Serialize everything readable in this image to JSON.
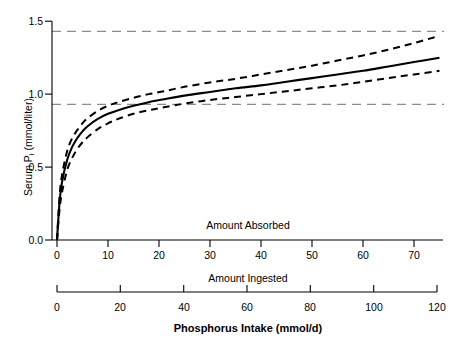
{
  "chart_data": {
    "type": "line",
    "title": "Phosphorus Intake (mmol/d)",
    "ylabel_prefix": "Serum P",
    "ylabel_sub": "i",
    "ylabel_suffix": " (mmol/liter)",
    "ylabel_full": "Serum Pi (mmol/liter)",
    "ylim": [
      0.0,
      1.5
    ],
    "yticks": [
      "0.0",
      "0.5",
      "1.0",
      "1.5"
    ],
    "ytick_values": [
      0.0,
      0.5,
      1.0,
      1.5
    ],
    "grid": false,
    "legend": "none",
    "axes": [
      {
        "name": "Amount Absorbed",
        "label": "Amount Absorbed",
        "ticks": [
          "0",
          "10",
          "20",
          "30",
          "40",
          "50",
          "60",
          "70"
        ],
        "tick_values": [
          0,
          10,
          20,
          30,
          40,
          50,
          60,
          70
        ],
        "xlim": [
          0,
          75
        ]
      },
      {
        "name": "Amount Ingested",
        "label": "Amount Ingested",
        "ticks": [
          "0",
          "20",
          "40",
          "60",
          "80",
          "100",
          "120"
        ],
        "tick_values": [
          0,
          20,
          40,
          60,
          80,
          100,
          120
        ],
        "xlim": [
          0,
          120
        ]
      }
    ],
    "reference_lines": [
      {
        "name": "upper-normal-limit",
        "y": 1.4,
        "style": "dashed",
        "color": "#808080"
      },
      {
        "name": "lower-normal-limit",
        "y": 0.9,
        "style": "dashed",
        "color": "#808080"
      }
    ],
    "series": [
      {
        "name": "Fitted serum phosphate curve",
        "style": "solid",
        "color": "#000000",
        "x": [
          0,
          0.5,
          1,
          2,
          3,
          4,
          5,
          6,
          8,
          10,
          12,
          15,
          18,
          21,
          25,
          30,
          35,
          40,
          45,
          50,
          55,
          60,
          65,
          70,
          75
        ],
        "y": [
          0.0,
          0.26,
          0.4,
          0.55,
          0.64,
          0.7,
          0.745,
          0.78,
          0.83,
          0.865,
          0.89,
          0.92,
          0.945,
          0.965,
          0.99,
          1.015,
          1.04,
          1.06,
          1.085,
          1.11,
          1.135,
          1.16,
          1.19,
          1.22,
          1.25
        ]
      },
      {
        "name": "Upper 95% confidence band",
        "style": "dashed",
        "color": "#000000",
        "x": [
          0,
          0.5,
          1,
          2,
          3,
          4,
          5,
          6,
          8,
          10,
          12,
          15,
          18,
          21,
          25,
          30,
          35,
          40,
          45,
          50,
          55,
          60,
          65,
          70,
          75
        ],
        "y": [
          0.0,
          0.3,
          0.45,
          0.61,
          0.7,
          0.755,
          0.8,
          0.835,
          0.885,
          0.92,
          0.945,
          0.975,
          1.0,
          1.02,
          1.05,
          1.08,
          1.105,
          1.135,
          1.165,
          1.195,
          1.23,
          1.265,
          1.305,
          1.35,
          1.4
        ]
      },
      {
        "name": "Lower 95% confidence band",
        "style": "dashed",
        "color": "#000000",
        "x": [
          0,
          0.5,
          1,
          2,
          3,
          4,
          5,
          6,
          8,
          10,
          12,
          15,
          18,
          21,
          25,
          30,
          35,
          40,
          45,
          50,
          55,
          60,
          65,
          70,
          75
        ],
        "y": [
          0.0,
          0.21,
          0.33,
          0.48,
          0.565,
          0.625,
          0.67,
          0.705,
          0.76,
          0.8,
          0.83,
          0.865,
          0.89,
          0.91,
          0.935,
          0.96,
          0.98,
          1.0,
          1.02,
          1.04,
          1.06,
          1.085,
          1.11,
          1.135,
          1.16
        ]
      }
    ]
  }
}
